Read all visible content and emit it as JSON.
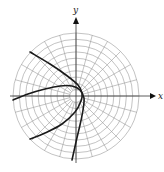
{
  "figure": {
    "type": "polar-graph",
    "center": {
      "x": 76,
      "y": 96
    },
    "radius": 63,
    "rings": 10,
    "radial_step_deg": 15,
    "grid_color": "#9a9a9a",
    "curve_color": "#1a1a1a",
    "axes": {
      "x_label": "x",
      "y_label": "y"
    },
    "curves": [
      {
        "name": "curve-1",
        "points": [
          [
            30,
            52
          ],
          [
            50,
            64
          ],
          [
            66,
            75
          ],
          [
            78,
            85
          ],
          [
            82,
            93
          ],
          [
            81,
            101
          ],
          [
            75,
            112
          ],
          [
            62,
            124
          ],
          [
            45,
            133
          ],
          [
            30,
            139
          ]
        ]
      },
      {
        "name": "curve-2",
        "points": [
          [
            13,
            100
          ],
          [
            28,
            94
          ],
          [
            45,
            89
          ],
          [
            60,
            86
          ],
          [
            72,
            86
          ],
          [
            80,
            90
          ],
          [
            84,
            98
          ],
          [
            83,
            110
          ],
          [
            80,
            125
          ],
          [
            76,
            142
          ],
          [
            72,
            160
          ]
        ]
      }
    ]
  }
}
